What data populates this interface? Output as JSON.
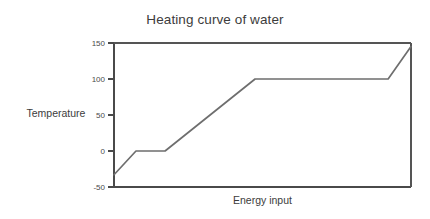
{
  "chart_data": {
    "type": "line",
    "title": "Heating curve of water",
    "xlabel": "Energy input",
    "ylabel": "Temperature",
    "grid": false,
    "legend": false,
    "xlim": [
      0,
      100
    ],
    "ylim": [
      -50,
      150
    ],
    "y_ticks": [
      {
        "value": 150,
        "label": "150"
      },
      {
        "value": 100,
        "label": "100"
      },
      {
        "value": 50,
        "label": "50"
      },
      {
        "value": 0,
        "label": "0"
      },
      {
        "value": -50,
        "label": "-50"
      }
    ],
    "x_ticks": [],
    "line_color": "#6e6e6e",
    "axis_color": "#4a4a4a",
    "series": [
      {
        "name": "Heating curve of water",
        "x": [
          0,
          7.4,
          17.2,
          47.5,
          92.3,
          100
        ],
        "y": [
          -33,
          0,
          0,
          100,
          100,
          145
        ],
        "segments": [
          {
            "phase": "ice warming",
            "from": [
              0,
              -33
            ],
            "to": [
              7.4,
              0
            ]
          },
          {
            "phase": "melting plateau",
            "from": [
              7.4,
              0
            ],
            "to": [
              17.2,
              0
            ]
          },
          {
            "phase": "liquid water warming",
            "from": [
              17.2,
              0
            ],
            "to": [
              47.5,
              100
            ]
          },
          {
            "phase": "boiling plateau",
            "from": [
              47.5,
              100
            ],
            "to": [
              92.3,
              100
            ]
          },
          {
            "phase": "steam warming",
            "from": [
              92.3,
              100
            ],
            "to": [
              100,
              145
            ]
          }
        ]
      }
    ]
  }
}
